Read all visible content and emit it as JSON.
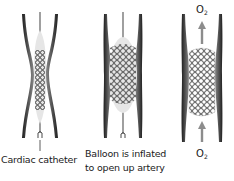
{
  "figure": {
    "panels": [
      {
        "id": "catheter",
        "label": "Cardiac catheter",
        "elements": [
          "artery-wall",
          "catheter",
          "deflated-balloon",
          "collapsed-stent"
        ]
      },
      {
        "id": "inflated",
        "label_line1": "Balloon is inflated",
        "label_line2": "to open up artery",
        "elements": [
          "artery-wall",
          "catheter",
          "inflated-balloon",
          "expanded-stent"
        ]
      },
      {
        "id": "stent",
        "o2_top": "O",
        "o2_top_sub": "2",
        "o2_bottom": "O",
        "o2_bottom_sub": "2",
        "elements": [
          "artery-wall",
          "expanded-stent",
          "oxygen-flow-arrows"
        ]
      }
    ]
  },
  "colors": {
    "wall_dark": "#1f1f1f",
    "wall_mid": "#6e6e6e",
    "balloon": "#e6e6e6",
    "stent": "#2a2a2a",
    "arrow": "#8c8c8c",
    "text": "#1a1a1a"
  }
}
